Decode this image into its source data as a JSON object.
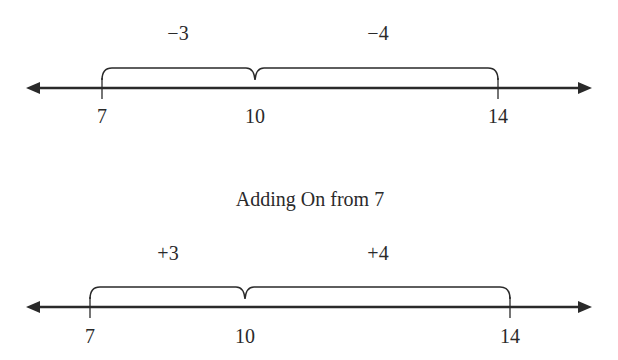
{
  "title": "Adding On from 7",
  "number_lines": [
    {
      "name": "subtracting",
      "ticks": [
        {
          "value": "7",
          "x": 102
        },
        {
          "value": "10",
          "x": 255
        },
        {
          "value": "14",
          "x": 498
        }
      ],
      "jumps": [
        {
          "label": "−3",
          "from": "10",
          "to": "7"
        },
        {
          "label": "−4",
          "from": "14",
          "to": "10"
        }
      ]
    },
    {
      "name": "adding-on",
      "ticks": [
        {
          "value": "7",
          "x": 90
        },
        {
          "value": "10",
          "x": 245
        },
        {
          "value": "14",
          "x": 510
        }
      ],
      "jumps": [
        {
          "label": "+3",
          "from": "7",
          "to": "10"
        },
        {
          "label": "+4",
          "from": "10",
          "to": "14"
        }
      ]
    }
  ],
  "colors": {
    "line": "#2a2a2a",
    "background": "#ffffff"
  }
}
